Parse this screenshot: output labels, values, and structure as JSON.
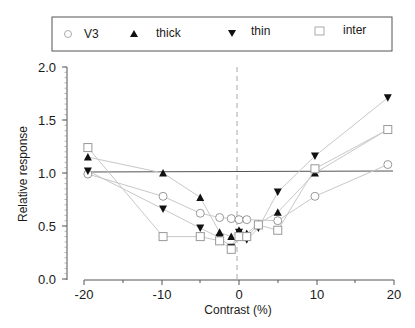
{
  "chart_data": {
    "type": "line",
    "title": "",
    "xlabel": "Contrast (%)",
    "ylabel": "Relative response",
    "xlim": [
      -20,
      20
    ],
    "ylim": [
      0.0,
      2.0
    ],
    "xticks": [
      -20,
      -10,
      0,
      10,
      20
    ],
    "xtick_labels": [
      "-20",
      "-10",
      "0",
      "10",
      "20"
    ],
    "yticks": [
      0.0,
      0.5,
      1.0,
      1.5,
      2.0
    ],
    "ytick_labels": [
      "0.0",
      "0.5",
      "1.0",
      "1.5",
      "2.0"
    ],
    "grid": false,
    "legend_position": "top, boxed, horizontal",
    "reference_lines": [
      {
        "type": "horizontal",
        "y": 1.0,
        "style": "solid",
        "color": "#555555"
      },
      {
        "type": "vertical",
        "x": 0,
        "style": "dashed",
        "color": "#999999"
      }
    ],
    "series": [
      {
        "name": "V3",
        "marker": "circle-open",
        "x": [
          -19.5,
          -9.8,
          -5,
          -2.5,
          -1,
          0,
          1,
          5,
          9.8,
          19.2
        ],
        "y": [
          0.99,
          0.78,
          0.62,
          0.58,
          0.57,
          0.56,
          0.56,
          0.55,
          0.78,
          1.08
        ]
      },
      {
        "name": "thick",
        "marker": "triangle-up-filled",
        "x": [
          -19.5,
          -9.8,
          -5,
          -2.5,
          -1,
          0,
          1,
          2.5,
          5,
          9.8,
          19.2
        ],
        "y": [
          1.15,
          1.0,
          0.77,
          0.44,
          0.4,
          0.46,
          0.43,
          0.52,
          0.63,
          1.0,
          1.41
        ]
      },
      {
        "name": "thin",
        "marker": "triangle-down-filled",
        "x": [
          -19.5,
          -9.8,
          -5,
          -2.5,
          -1,
          0,
          1,
          2.5,
          5,
          9.8,
          19.2
        ],
        "y": [
          1.02,
          0.66,
          0.48,
          0.39,
          0.3,
          0.44,
          0.37,
          0.48,
          0.82,
          1.16,
          1.71
        ]
      },
      {
        "name": "inter",
        "marker": "square-open",
        "x": [
          -19.5,
          -9.8,
          -5,
          -2.5,
          -1,
          0,
          1,
          2.5,
          5,
          9.8,
          19.2
        ],
        "y": [
          1.24,
          0.4,
          0.4,
          0.36,
          0.28,
          0.4,
          0.4,
          0.51,
          0.46,
          1.04,
          1.41
        ]
      }
    ]
  },
  "legend": {
    "items": [
      {
        "label": "V3",
        "marker": "circle-open"
      },
      {
        "label": "thick",
        "marker": "triangle-up-filled"
      },
      {
        "label": "thin",
        "marker": "triangle-down-filled"
      },
      {
        "label": "inter",
        "marker": "square-open"
      }
    ]
  },
  "axes": {
    "xlabel": "Contrast (%)",
    "ylabel": "Relative response"
  }
}
